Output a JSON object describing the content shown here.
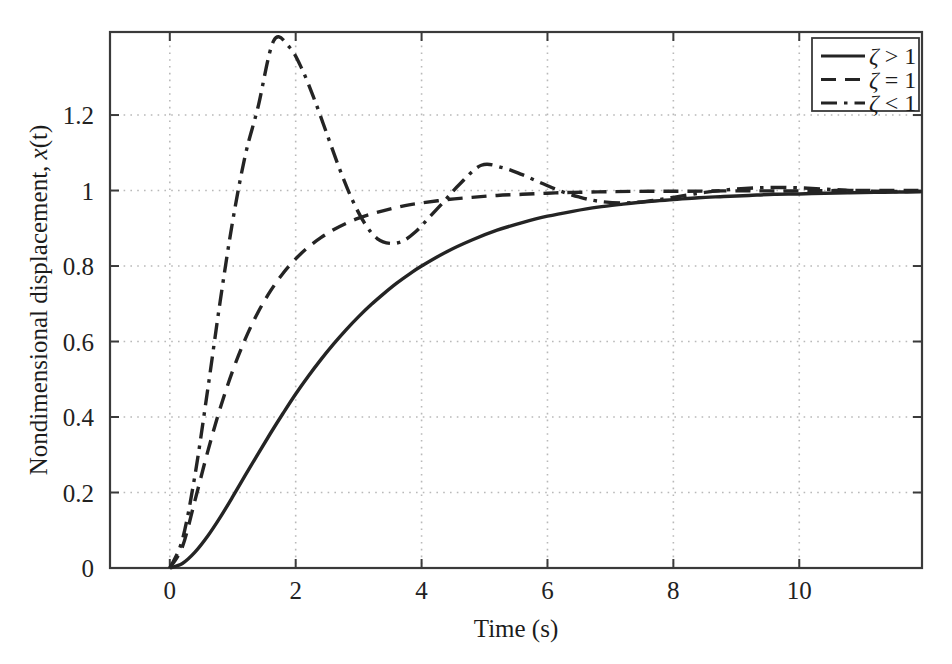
{
  "figure": {
    "background_color": "#ffffff",
    "axis_color": "#3a3a3a",
    "grid_color": "#b9b9b9",
    "curve_color": "#242424"
  },
  "chart_data": {
    "type": "line",
    "title": "",
    "xlabel": "Time (s)",
    "ylabel": "Nondimensional displacement, x(t)",
    "xlim": [
      -0.95,
      11.95
    ],
    "ylim": [
      0,
      1.42
    ],
    "grid": true,
    "grid_style": "dotted",
    "legend_position": "top-right",
    "xticks": [
      0,
      2,
      4,
      6,
      8,
      10
    ],
    "xtick_labels": [
      "0",
      "2",
      "4",
      "6",
      "8",
      "10"
    ],
    "yticks": [
      0,
      0.2,
      0.4,
      0.6,
      0.8,
      1,
      1.2
    ],
    "ytick_labels": [
      "0",
      "0.2",
      "0.4",
      "0.6",
      "0.8",
      "1",
      "1.2"
    ],
    "annotations": {
      "overshoot_peak": {
        "t": 1.65,
        "x": 1.4
      },
      "first_undershoot": {
        "t": 3.3,
        "x": 0.87
      },
      "second_peak": {
        "t": 4.95,
        "x": 1.07
      },
      "steady_state": 1.0
    },
    "series": [
      {
        "name": "zeta-greater-than-one",
        "legend_symbol": "ζ",
        "legend_relation": ">",
        "legend_value": "1",
        "legend_text": "ζ > 1",
        "line_style": "solid",
        "color": "#242424",
        "damping_regime": "overdamped",
        "x": [
          0,
          0.2,
          0.4,
          0.6,
          0.8,
          1.0,
          1.2,
          1.4,
          1.6,
          1.8,
          2.0,
          2.2,
          2.4,
          2.6,
          2.8,
          3.0,
          3.2,
          3.4,
          3.6,
          3.8,
          4.0,
          4.4,
          4.8,
          5.2,
          5.6,
          6.0,
          6.4,
          6.8,
          7.2,
          7.6,
          8.0,
          8.4,
          8.8,
          9.2,
          9.6,
          10.0,
          10.4,
          10.8,
          11.2,
          11.6,
          11.95
        ],
        "y": [
          0,
          0.012,
          0.042,
          0.084,
          0.134,
          0.189,
          0.246,
          0.302,
          0.357,
          0.41,
          0.461,
          0.508,
          0.552,
          0.593,
          0.631,
          0.666,
          0.698,
          0.727,
          0.754,
          0.778,
          0.8,
          0.838,
          0.869,
          0.895,
          0.915,
          0.932,
          0.945,
          0.956,
          0.964,
          0.971,
          0.976,
          0.981,
          0.984,
          0.987,
          0.99,
          0.991,
          0.993,
          0.994,
          0.995,
          0.996,
          0.997
        ]
      },
      {
        "name": "zeta-equals-one",
        "legend_symbol": "ζ",
        "legend_relation": "=",
        "legend_value": "1",
        "legend_text": "ζ = 1",
        "line_style": "dashed",
        "color": "#242424",
        "damping_regime": "critically damped",
        "x": [
          0,
          0.2,
          0.4,
          0.6,
          0.8,
          1.0,
          1.2,
          1.4,
          1.6,
          1.8,
          2.0,
          2.2,
          2.4,
          2.6,
          2.8,
          3.0,
          3.2,
          3.4,
          3.6,
          3.8,
          4.0,
          4.4,
          4.8,
          5.2,
          5.6,
          6.0,
          6.4,
          7.0,
          7.6,
          8.2,
          8.8,
          9.4,
          10.0,
          10.6,
          11.2,
          11.95
        ],
        "y": [
          0,
          0.056,
          0.179,
          0.307,
          0.423,
          0.523,
          0.607,
          0.677,
          0.734,
          0.781,
          0.819,
          0.85,
          0.875,
          0.896,
          0.913,
          0.927,
          0.938,
          0.947,
          0.955,
          0.962,
          0.967,
          0.976,
          0.982,
          0.987,
          0.99,
          0.993,
          0.995,
          0.997,
          0.998,
          0.998,
          0.999,
          0.999,
          0.999,
          1.0,
          1.0,
          1.0
        ]
      },
      {
        "name": "zeta-less-than-one",
        "legend_symbol": "ζ",
        "legend_relation": "<",
        "legend_value": "1",
        "legend_text": "ζ < 1",
        "line_style": "dash-dot",
        "color": "#242424",
        "damping_regime": "underdamped",
        "x": [
          0,
          0.2,
          0.4,
          0.6,
          0.8,
          1.0,
          1.2,
          1.4,
          1.65,
          1.9,
          2.1,
          2.3,
          2.5,
          2.7,
          2.9,
          3.1,
          3.3,
          3.5,
          3.7,
          3.9,
          4.1,
          4.35,
          4.6,
          4.95,
          5.3,
          5.6,
          5.9,
          6.2,
          6.5,
          6.8,
          7.2,
          7.6,
          8.0,
          8.5,
          9.0,
          9.5,
          10.0,
          10.6,
          11.2,
          11.95
        ],
        "y": [
          0,
          0.075,
          0.246,
          0.47,
          0.706,
          0.92,
          1.094,
          1.22,
          1.397,
          1.38,
          1.322,
          1.24,
          1.148,
          1.056,
          0.975,
          0.912,
          0.872,
          0.86,
          0.866,
          0.89,
          0.925,
          0.97,
          1.016,
          1.067,
          1.06,
          1.042,
          1.02,
          0.999,
          0.983,
          0.972,
          0.967,
          0.972,
          0.982,
          0.995,
          1.004,
          1.008,
          1.007,
          1.002,
          0.998,
          0.997
        ]
      }
    ]
  },
  "legend": {
    "items": [
      {
        "label": "ζ > 1",
        "symbol": "ζ",
        "relation": ">",
        "value": "1",
        "style": "solid"
      },
      {
        "label": "ζ = 1",
        "symbol": "ζ",
        "relation": "=",
        "value": "1",
        "style": "dashed"
      },
      {
        "label": "ζ < 1",
        "symbol": "ζ",
        "relation": "<",
        "value": "1",
        "style": "dash-dot"
      }
    ]
  }
}
